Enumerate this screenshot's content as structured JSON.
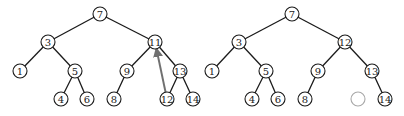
{
  "diagram": {
    "trees": [
      {
        "name": "before",
        "nodes": [
          {
            "id": "a7",
            "label": "7",
            "x": 100,
            "y": 14
          },
          {
            "id": "a3",
            "label": "3",
            "x": 48,
            "y": 42
          },
          {
            "id": "a11",
            "label": "11",
            "x": 155,
            "y": 42
          },
          {
            "id": "a1",
            "label": "1",
            "x": 20,
            "y": 71
          },
          {
            "id": "a5",
            "label": "5",
            "x": 75,
            "y": 71
          },
          {
            "id": "a9",
            "label": "9",
            "x": 127,
            "y": 71
          },
          {
            "id": "a13",
            "label": "13",
            "x": 180,
            "y": 71
          },
          {
            "id": "a4",
            "label": "4",
            "x": 61,
            "y": 99
          },
          {
            "id": "a6",
            "label": "6",
            "x": 87,
            "y": 99
          },
          {
            "id": "a8",
            "label": "8",
            "x": 114,
            "y": 99
          },
          {
            "id": "a12",
            "label": "12",
            "x": 167,
            "y": 99
          },
          {
            "id": "a14",
            "label": "14",
            "x": 193,
            "y": 99
          }
        ],
        "edges": [
          [
            "a7",
            "a3"
          ],
          [
            "a7",
            "a11"
          ],
          [
            "a3",
            "a1"
          ],
          [
            "a3",
            "a5"
          ],
          [
            "a5",
            "a4"
          ],
          [
            "a5",
            "a6"
          ],
          [
            "a11",
            "a9"
          ],
          [
            "a11",
            "a13"
          ],
          [
            "a9",
            "a8"
          ],
          [
            "a13",
            "a12"
          ],
          [
            "a13",
            "a14"
          ]
        ],
        "arrow": {
          "from": "a12",
          "to": "a11",
          "color": "#707070"
        }
      },
      {
        "name": "after",
        "nodes": [
          {
            "id": "b7",
            "label": "7",
            "x": 292,
            "y": 14
          },
          {
            "id": "b3",
            "label": "3",
            "x": 239,
            "y": 42
          },
          {
            "id": "b12",
            "label": "12",
            "x": 345,
            "y": 42
          },
          {
            "id": "b1",
            "label": "1",
            "x": 212,
            "y": 71
          },
          {
            "id": "b5",
            "label": "5",
            "x": 266,
            "y": 71
          },
          {
            "id": "b9",
            "label": "9",
            "x": 318,
            "y": 71
          },
          {
            "id": "b13",
            "label": "13",
            "x": 372,
            "y": 71
          },
          {
            "id": "b4",
            "label": "4",
            "x": 252,
            "y": 99
          },
          {
            "id": "b6",
            "label": "6",
            "x": 278,
            "y": 99
          },
          {
            "id": "b8",
            "label": "8",
            "x": 305,
            "y": 99
          },
          {
            "id": "bempty",
            "label": "",
            "x": 358,
            "y": 99,
            "empty": true
          },
          {
            "id": "b14",
            "label": "14",
            "x": 385,
            "y": 99
          }
        ],
        "edges": [
          [
            "b7",
            "b3"
          ],
          [
            "b7",
            "b12"
          ],
          [
            "b3",
            "b1"
          ],
          [
            "b3",
            "b5"
          ],
          [
            "b5",
            "b4"
          ],
          [
            "b5",
            "b6"
          ],
          [
            "b12",
            "b9"
          ],
          [
            "b12",
            "b13"
          ],
          [
            "b9",
            "b8"
          ],
          [
            "b13",
            "b14"
          ]
        ]
      }
    ],
    "node_radius": 7,
    "colors": {
      "stroke": "#1a1a1a",
      "empty_stroke": "#a8a8a8",
      "arrow": "#707070",
      "background": "#ffffff"
    }
  }
}
